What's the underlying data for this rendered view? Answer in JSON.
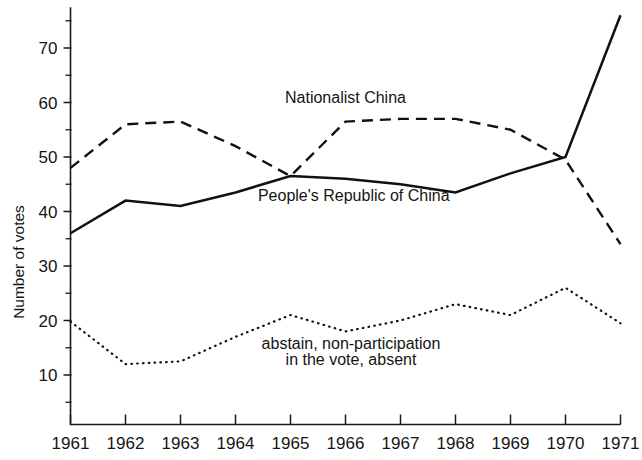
{
  "chart_data": {
    "type": "line",
    "title": "",
    "xlabel": "",
    "ylabel": "Number of votes",
    "x": [
      1961,
      1962,
      1963,
      1964,
      1965,
      1966,
      1967,
      1968,
      1969,
      1970,
      1971
    ],
    "xtick_labels": [
      "1961",
      "1962",
      "1963",
      "1964",
      "1965",
      "1966",
      "1967",
      "1968",
      "1969",
      "1970",
      "1971"
    ],
    "ytick_labels": [
      "10",
      "20",
      "30",
      "40",
      "50",
      "60",
      "70"
    ],
    "ytick_values": [
      10,
      20,
      30,
      40,
      50,
      60,
      70
    ],
    "yminor_values": [
      5,
      15,
      25,
      35,
      45,
      55,
      65,
      75
    ],
    "xlim": [
      1961,
      1971
    ],
    "ylim": [
      0,
      77
    ],
    "grid": false,
    "legend": "inline-annotations",
    "series": [
      {
        "name": "People's Republic of China",
        "style": "solid",
        "label": "People's Republic of China",
        "label_x": 1966.15,
        "label_y": 42.0,
        "values": [
          36,
          42,
          41,
          43.5,
          46.5,
          46,
          45,
          43.5,
          47,
          50,
          76
        ]
      },
      {
        "name": "Nationalist China",
        "style": "dashed",
        "label": "Nationalist China",
        "label_x": 1966.0,
        "label_y": 60.0,
        "values": [
          48,
          56,
          56.5,
          52,
          46.5,
          56.5,
          57,
          57,
          55,
          49.5,
          34
        ]
      },
      {
        "name": "abstain, non-participation in the vote, absent",
        "style": "dotted",
        "label_line1": "abstain, non-participation",
        "label_line2": "in the vote, absent",
        "label_x": 1966.1,
        "label_y": 14.8,
        "values": [
          19.8,
          12,
          12.5,
          17,
          21,
          18,
          20,
          23,
          21,
          26,
          19.5
        ]
      }
    ]
  },
  "colors": {
    "ink": "#111111",
    "background": "#ffffff"
  }
}
